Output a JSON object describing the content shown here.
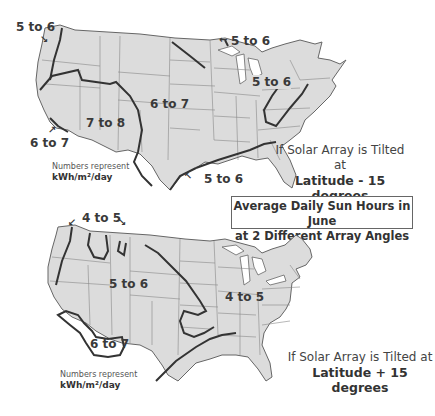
{
  "title": {
    "line1": "Average Daily Sun Hours in June",
    "line2": "at 2 Different Array Angles"
  },
  "colors": {
    "land": "#dcdcdc",
    "state_borders": "#7a7a7a",
    "zone_lines": "#333333",
    "text": "#333333"
  },
  "maps": [
    {
      "id": "minus15",
      "caption_line1": "If Solar Array is Tilted at",
      "caption_line2": "Latitude - 15 degrees",
      "units_line1": "Numbers represent",
      "units_line2": "kWh/m²/day",
      "zones": [
        {
          "label": "5 to 6",
          "location": "Pacific Northwest coast"
        },
        {
          "label": "5 to 6",
          "location": "Great Lakes / Upper Midwest"
        },
        {
          "label": "5 to 6",
          "location": "Northeast / Mid-Atlantic"
        },
        {
          "label": "6 to 7",
          "location": "Central / Plains"
        },
        {
          "label": "7 to 8",
          "location": "Southwest"
        },
        {
          "label": "6 to 7",
          "location": "Southern California coast"
        },
        {
          "label": "5 to 6",
          "location": "Gulf Coast / Florida"
        }
      ]
    },
    {
      "id": "plus15",
      "caption_line1": "If Solar Array is Tilted at",
      "caption_line2": "Latitude + 15 degrees",
      "units_line1": "Numbers represent",
      "units_line2": "kWh/m²/day",
      "zones": [
        {
          "label": "4 to 5",
          "location": "Northern Rockies / Pacific NW"
        },
        {
          "label": "5 to 6",
          "location": "West / Central"
        },
        {
          "label": "4 to 5",
          "location": "Midwest / East"
        },
        {
          "label": "6 to 7",
          "location": "Desert Southwest"
        }
      ]
    }
  ],
  "labels": {
    "top": {
      "pnw": "5 to 6",
      "lakes": "5 to 6",
      "east": "5 to 6",
      "central": "6 to 7",
      "sw": "7 to 8",
      "socal": "6 to 7",
      "gulf": "5 to 6"
    },
    "bottom": {
      "north": "4 to 5",
      "west": "5 to 6",
      "east": "4 to 5",
      "sw": "6 to 7"
    }
  }
}
